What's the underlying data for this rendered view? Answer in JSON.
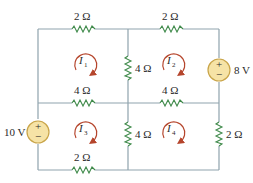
{
  "colors": {
    "wire": "#8fa3ad",
    "resistor": "#3f8a4a",
    "source_fill": "#f6e3a6",
    "source_stroke": "#c9a54a",
    "mesh_arrow": "#b5452c",
    "text": "#2a2a2a"
  },
  "resistors": {
    "top_left": "2 Ω",
    "top_right": "2 Ω",
    "mid_vertical_upper": "4 Ω",
    "mid_horizontal_left": "4 Ω",
    "mid_horizontal_right": "4 Ω",
    "mid_vertical_lower": "4 Ω",
    "right_vertical_lower": "2 Ω",
    "bottom_left": "2 Ω"
  },
  "sources": {
    "right": {
      "label": "8 V",
      "plus": "+",
      "minus": "−"
    },
    "left": {
      "label": "10 V",
      "plus": "+",
      "minus": "−"
    }
  },
  "meshes": [
    {
      "symbol": "I",
      "sub": "1"
    },
    {
      "symbol": "I",
      "sub": "2"
    },
    {
      "symbol": "I",
      "sub": "3"
    },
    {
      "symbol": "I",
      "sub": "4"
    }
  ]
}
